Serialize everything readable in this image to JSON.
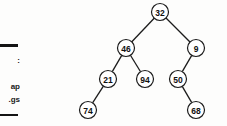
{
  "page": {
    "width": 227,
    "height": 126,
    "background": "#fdfdfc",
    "ink_color": "#1b1b1b"
  },
  "margin_text": {
    "fragment_1": ":",
    "fragment_2": "ap",
    "fragment_3": "gs.",
    "rule_top_label": "horizontal-rule",
    "rule_bottom_label": "horizontal-rule"
  },
  "diagram": {
    "type": "binary-tree",
    "node_radius": 8.5,
    "nodes": [
      {
        "id": "n32",
        "value": "32",
        "cx": 160,
        "cy": 12,
        "level": 0
      },
      {
        "id": "n46",
        "value": "46",
        "cx": 126,
        "cy": 48,
        "level": 1
      },
      {
        "id": "n9",
        "value": "9",
        "cx": 196,
        "cy": 48,
        "level": 1
      },
      {
        "id": "n21",
        "value": "21",
        "cx": 108,
        "cy": 79,
        "level": 2
      },
      {
        "id": "n94",
        "value": "94",
        "cx": 145,
        "cy": 79,
        "level": 2
      },
      {
        "id": "n50",
        "value": "50",
        "cx": 178,
        "cy": 79,
        "level": 2
      },
      {
        "id": "n74",
        "value": "74",
        "cx": 88,
        "cy": 110,
        "level": 3
      },
      {
        "id": "n68",
        "value": "68",
        "cx": 196,
        "cy": 110,
        "level": 3
      }
    ],
    "edges": [
      {
        "from": "n32",
        "to": "n46",
        "side": "left"
      },
      {
        "from": "n32",
        "to": "n9",
        "side": "right"
      },
      {
        "from": "n46",
        "to": "n21",
        "side": "left"
      },
      {
        "from": "n46",
        "to": "n94",
        "side": "right"
      },
      {
        "from": "n9",
        "to": "n50",
        "side": "left"
      },
      {
        "from": "n50",
        "to": "n68",
        "side": "right"
      },
      {
        "from": "n21",
        "to": "n74",
        "side": "left"
      }
    ]
  }
}
